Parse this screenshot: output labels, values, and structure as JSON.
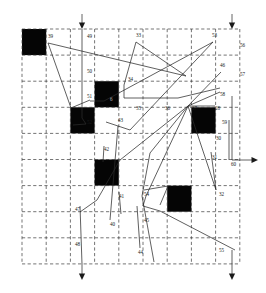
{
  "figure": {
    "title": "",
    "type": "grid-routing-diagram",
    "colors": {
      "obstacle": "#050505",
      "grid": "#3a3a3a",
      "path": "#2b2b2b",
      "label": "#1b1b1b",
      "background": "#ffffff"
    },
    "grid": {
      "x0": 22,
      "y0": 29,
      "cols": 9,
      "rows": 9,
      "cell_w": 24.2,
      "cell_h": 26.1,
      "dashed": true
    },
    "obstacles": [
      {
        "name": "obstacle-r0c0",
        "col": 0,
        "row": 0
      },
      {
        "name": "obstacle-r2c3",
        "col": 3,
        "row": 2
      },
      {
        "name": "obstacle-r3c2",
        "col": 2,
        "row": 3
      },
      {
        "name": "obstacle-r3c7",
        "col": 7,
        "row": 3
      },
      {
        "name": "obstacle-r5c3",
        "col": 3,
        "row": 5
      },
      {
        "name": "obstacle-r6c6",
        "col": 6,
        "row": 6
      }
    ],
    "labels": [
      {
        "name": "label-39",
        "text": "39",
        "x": 48,
        "y": 38
      },
      {
        "name": "label-49",
        "text": "49",
        "x": 87,
        "y": 38
      },
      {
        "name": "label-33",
        "text": "33",
        "x": 136,
        "y": 37
      },
      {
        "name": "label-53",
        "text": "53",
        "x": 212,
        "y": 37
      },
      {
        "name": "label-56",
        "text": "56",
        "x": 240,
        "y": 47
      },
      {
        "name": "label-50",
        "text": "50",
        "x": 87,
        "y": 73
      },
      {
        "name": "label-46",
        "text": "46",
        "x": 220,
        "y": 67
      },
      {
        "name": "label-57",
        "text": "57",
        "x": 240,
        "y": 76
      },
      {
        "name": "label-34",
        "text": "34",
        "x": 128,
        "y": 81
      },
      {
        "name": "label-51",
        "text": "51",
        "x": 87,
        "y": 98
      },
      {
        "name": "label-6",
        "text": "6",
        "x": 110,
        "y": 101,
        "style": "light"
      },
      {
        "name": "label-58",
        "text": "58",
        "x": 220,
        "y": 96
      },
      {
        "name": "label-35",
        "text": "35",
        "x": 136,
        "y": 110
      },
      {
        "name": "label-36",
        "text": "36",
        "x": 165,
        "y": 110
      },
      {
        "name": "label-37",
        "text": "37",
        "x": 192,
        "y": 110
      },
      {
        "name": "label-28",
        "text": "28",
        "x": 215,
        "y": 110
      },
      {
        "name": "label-52",
        "text": "52",
        "x": 87,
        "y": 124
      },
      {
        "name": "label-43",
        "text": "43",
        "x": 118,
        "y": 122
      },
      {
        "name": "label-59",
        "text": "59",
        "x": 222,
        "y": 124
      },
      {
        "name": "label-30",
        "text": "30",
        "x": 216,
        "y": 140
      },
      {
        "name": "label-42",
        "text": "42",
        "x": 104,
        "y": 151
      },
      {
        "name": "label-31",
        "text": "31",
        "x": 212,
        "y": 159
      },
      {
        "name": "label-60",
        "text": "60",
        "x": 231,
        "y": 166
      },
      {
        "name": "label-41",
        "text": "41",
        "x": 119,
        "y": 198
      },
      {
        "name": "label-54",
        "text": "54",
        "x": 144,
        "y": 196
      },
      {
        "name": "label-32",
        "text": "32",
        "x": 219,
        "y": 196
      },
      {
        "name": "label-47",
        "text": "47",
        "x": 75,
        "y": 211
      },
      {
        "name": "label-40",
        "text": "40",
        "x": 110,
        "y": 226
      },
      {
        "name": "label-45",
        "text": "45",
        "x": 144,
        "y": 222
      },
      {
        "name": "label-48",
        "text": "48",
        "x": 75,
        "y": 246
      },
      {
        "name": "label-44",
        "text": "44",
        "x": 138,
        "y": 254
      },
      {
        "name": "label-55",
        "text": "55",
        "x": 219,
        "y": 252
      }
    ],
    "io_ports": [
      {
        "name": "input-arrow-top-left",
        "direction": "down",
        "x": 82,
        "y_from": 14,
        "y_to": 29
      },
      {
        "name": "input-arrow-top-right",
        "direction": "down",
        "x": 232,
        "y_from": 14,
        "y_to": 29
      },
      {
        "name": "output-arrow-bottom-left",
        "direction": "down",
        "x": 82,
        "y_from": 264,
        "y_to": 280
      },
      {
        "name": "output-arrow-bottom-right",
        "direction": "down",
        "x": 232,
        "y_from": 264,
        "y_to": 280
      },
      {
        "name": "output-arrow-right",
        "direction": "right",
        "x_from": 240,
        "x_to": 258,
        "y": 160
      }
    ],
    "nets": [
      {
        "name": "net-39",
        "points": "48,43 71,108 90,100"
      },
      {
        "name": "net-49",
        "points": "82,29 82,118 86,124 73,125"
      },
      {
        "name": "net-50-33",
        "points": "48,43 186,76 136,42"
      },
      {
        "name": "net-33-branch",
        "points": "136,42 124,85 124,98 178,98 220,88"
      },
      {
        "name": "net-53-diag",
        "points": "213,42 104,101 90,101"
      },
      {
        "name": "net-53-lower",
        "points": "213,42 130,130 106,122"
      },
      {
        "name": "net-46-fan",
        "points": "221,72 188,106 150,153 142,196 154,262"
      },
      {
        "name": "net-58-in",
        "points": "220,92 188,106"
      },
      {
        "name": "net-37-cross1",
        "points": "188,106 216,190"
      },
      {
        "name": "net-37-cross2",
        "points": "188,106 120,160 97,200 80,212"
      },
      {
        "name": "net-37-cross3",
        "points": "188,106 146,196 143,206 160,211 235,250"
      },
      {
        "name": "net-28-line",
        "points": "215,106 188,106"
      },
      {
        "name": "net-43",
        "points": "118,126 112,196 110,220"
      },
      {
        "name": "net-42",
        "points": "104,146 103,162"
      },
      {
        "name": "net-41",
        "points": "119,192 121,214"
      },
      {
        "name": "net-54",
        "points": "144,190 168,186 160,205"
      },
      {
        "name": "net-59-30",
        "points": "229,120 229,160"
      },
      {
        "name": "net-31-32",
        "points": "211,152 216,190"
      },
      {
        "name": "net-60",
        "points": "232,96 232,160 240,160"
      },
      {
        "name": "net-47-48",
        "points": "80,206 82,264"
      },
      {
        "name": "net-55",
        "points": "232,250 232,264"
      },
      {
        "name": "net-44",
        "points": "140,248 137,206"
      }
    ]
  }
}
